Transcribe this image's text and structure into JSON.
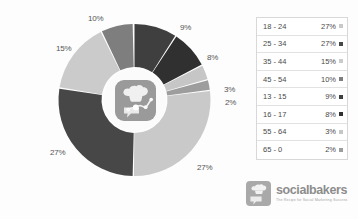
{
  "chart_data": {
    "type": "pie",
    "title": "",
    "subtitle": "",
    "xlabel": "",
    "ylabel": "",
    "legend_position": "right",
    "donut": true,
    "categories": [
      "13 - 15",
      "16 - 17",
      "55 - 64",
      "65 - 0",
      "18 - 24",
      "25 - 34",
      "35 - 44",
      "45 - 54"
    ],
    "values": [
      9,
      8,
      3,
      2,
      27,
      27,
      15,
      10
    ],
    "slices": [
      {
        "label": "9%",
        "value": 9,
        "category": "13 - 15",
        "color": "#3f3f3f",
        "start_angle": 0,
        "end_angle": 32.4
      },
      {
        "label": "8%",
        "value": 8,
        "category": "16 - 17",
        "color": "#303030",
        "start_angle": 33.4,
        "end_angle": 62.2
      },
      {
        "label": "3%",
        "value": 3,
        "category": "55 - 64",
        "color": "#c6c6c6",
        "start_angle": 63.2,
        "end_angle": 74.0
      },
      {
        "label": "2%",
        "value": 2,
        "category": "65 - 0",
        "color": "#9d9d9d",
        "start_angle": 75.0,
        "end_angle": 82.2
      },
      {
        "label": "27%",
        "value": 27,
        "category": "18 - 24",
        "color": "#c9c9c9",
        "start_angle": 83.2,
        "end_angle": 180.4
      },
      {
        "label": "27%",
        "value": 27,
        "category": "25 - 34",
        "color": "#474747",
        "start_angle": 181.4,
        "end_angle": 278.6
      },
      {
        "label": "15%",
        "value": 15,
        "category": "35 - 44",
        "color": "#cbcbcb",
        "start_angle": 279.6,
        "end_angle": 333.6
      },
      {
        "label": "10%",
        "value": 10,
        "category": "45 - 54",
        "color": "#7e7e7e",
        "start_angle": 334.6,
        "end_angle": 358.6
      }
    ],
    "slice_labels": [
      {
        "text": "10%",
        "x": 88,
        "y": 14
      },
      {
        "text": "9%",
        "x": 180,
        "y": 23
      },
      {
        "text": "8%",
        "x": 207,
        "y": 53
      },
      {
        "text": "3%",
        "x": 224,
        "y": 85
      },
      {
        "text": "2%",
        "x": 225,
        "y": 98
      },
      {
        "text": "27%",
        "x": 197,
        "y": 163
      },
      {
        "text": "27%",
        "x": 50,
        "y": 148
      },
      {
        "text": "15%",
        "x": 56,
        "y": 44
      }
    ]
  },
  "legend": {
    "rows": [
      {
        "range": "18 - 24",
        "percent": "27%",
        "color": "#c9c9c9"
      },
      {
        "range": "25 - 34",
        "percent": "27%",
        "color": "#474747"
      },
      {
        "range": "35 - 44",
        "percent": "15%",
        "color": "#cbcbcb"
      },
      {
        "range": "45 - 54",
        "percent": "10%",
        "color": "#7e7e7e"
      },
      {
        "range": "13 - 15",
        "percent": "9%",
        "color": "#3f3f3f"
      },
      {
        "range": "16 - 17",
        "percent": "8%",
        "color": "#303030"
      },
      {
        "range": "55 - 64",
        "percent": "3%",
        "color": "#c6c6c6"
      },
      {
        "range": "65 - 0",
        "percent": "2%",
        "color": "#9d9d9d"
      }
    ]
  },
  "brand": {
    "name": "socialbakers",
    "tagline": "The Recipe for Social Marketing Success"
  },
  "colors": {
    "background": "#fdfdfd",
    "label_text": "#555555",
    "legend_border": "#d8d8d8",
    "brand_text": "#8d8d8d"
  }
}
